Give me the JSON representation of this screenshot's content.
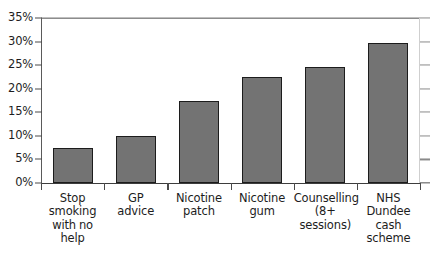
{
  "chart_data": {
    "type": "bar",
    "title": "",
    "subtitle": "",
    "xlabel": "",
    "ylabel": "",
    "ylim": [
      0,
      35
    ],
    "ytick_step": 5,
    "ytick_labels": [
      "0%",
      "5%",
      "10%",
      "15%",
      "20%",
      "25%",
      "30%",
      "35%"
    ],
    "ytick_values": [
      0,
      5,
      10,
      15,
      20,
      25,
      30,
      35
    ],
    "grid": true,
    "legend": false,
    "value_unit": "%",
    "categories": [
      "Stop smoking with no help",
      "GP advice",
      "Nicotine patch",
      "Nicotine gum",
      "Counselling (8+ sessions)",
      "NHS Dundee cash scheme"
    ],
    "category_lines": [
      [
        "Stop",
        "smoking",
        "with no",
        "help"
      ],
      [
        "GP",
        "advice"
      ],
      [
        "Nicotine",
        "patch"
      ],
      [
        "Nicotine",
        "gum"
      ],
      [
        "Counselling",
        "(8+",
        "sessions)"
      ],
      [
        "NHS",
        "Dundee",
        "cash",
        "scheme"
      ]
    ],
    "values": [
      7.5,
      10.0,
      17.5,
      22.5,
      24.6,
      29.8
    ]
  },
  "style": {
    "bar_fill": "#737373",
    "bar_stroke": "#1c1c1c",
    "grid_color": "#8a8a8a",
    "axis_color": "#3d3d3d",
    "text_color": "#1d1d1d",
    "background": "#ffffff"
  }
}
